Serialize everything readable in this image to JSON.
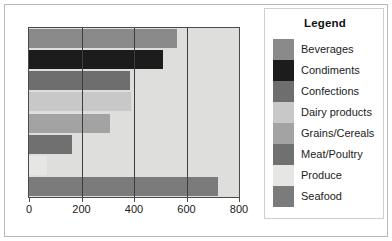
{
  "chart_data": {
    "type": "bar",
    "orientation": "horizontal",
    "title": "",
    "subtitle": "",
    "xlabel": "",
    "ylabel": "",
    "xlim": [
      0,
      800
    ],
    "ylim": null,
    "xticks": [
      0,
      200,
      400,
      600,
      800
    ],
    "xtick_labels": [
      "0",
      "200",
      "400",
      "600",
      "800"
    ],
    "ytick_labels": [],
    "grid": true,
    "grid_axis": "x",
    "gridlines_at": [
      200,
      400,
      600
    ],
    "legend_position": "right",
    "legend_title": "Legend",
    "categories": [
      "Beverages",
      "Condiments",
      "Confections",
      "Dairy products",
      "Grains/Cereals",
      "Meat/Poultry",
      "Produce",
      "Seafood"
    ],
    "values": [
      565,
      510,
      385,
      390,
      310,
      165,
      70,
      720
    ],
    "colors": [
      "#8a8a8a",
      "#1c1c1c",
      "#6e6e6e",
      "#c8c8c8",
      "#a3a3a3",
      "#707070",
      "#e6e6e4",
      "#7b7b7b"
    ],
    "plot_background": "#dededc",
    "frame_color": "#4a4a4a",
    "series": [
      {
        "name": "Sales",
        "values": [
          565,
          510,
          385,
          390,
          310,
          165,
          70,
          720
        ]
      }
    ]
  },
  "legend": {
    "title": "Legend",
    "items": [
      {
        "label": "Beverages",
        "color": "#8a8a8a"
      },
      {
        "label": "Condiments",
        "color": "#1c1c1c"
      },
      {
        "label": "Confections",
        "color": "#6e6e6e"
      },
      {
        "label": "Dairy products",
        "color": "#c8c8c8"
      },
      {
        "label": "Grains/Cereals",
        "color": "#a3a3a3"
      },
      {
        "label": "Meat/Poultry",
        "color": "#707070"
      },
      {
        "label": "Produce",
        "color": "#e6e6e4"
      },
      {
        "label": "Seafood",
        "color": "#7b7b7b"
      }
    ]
  }
}
